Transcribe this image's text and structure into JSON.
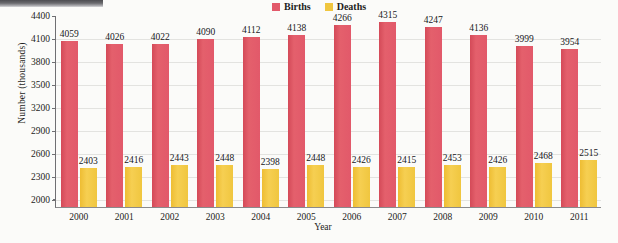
{
  "chart_data": {
    "type": "bar",
    "title": "",
    "xlabel": "Year",
    "ylabel": "Number (thousands)",
    "categories": [
      "2000",
      "2001",
      "2002",
      "2003",
      "2004",
      "2005",
      "2006",
      "2007",
      "2008",
      "2009",
      "2010",
      "2011"
    ],
    "series": [
      {
        "name": "Births",
        "color": "#e2596a",
        "values": [
          4059,
          4026,
          4022,
          4090,
          4112,
          4138,
          4266,
          4315,
          4247,
          4136,
          3999,
          3954
        ]
      },
      {
        "name": "Deaths",
        "color": "#f0c63f",
        "values": [
          2403,
          2416,
          2443,
          2448,
          2398,
          2448,
          2426,
          2415,
          2453,
          2426,
          2468,
          2515
        ]
      }
    ],
    "ylim": [
      1900,
      4400
    ],
    "yticks": [
      2000,
      2300,
      2600,
      2900,
      3200,
      3500,
      3800,
      4100,
      4400
    ],
    "grid": true,
    "legend_position": "top-right"
  },
  "legend": {
    "entries": [
      {
        "label": "Births",
        "color": "#e2596a"
      },
      {
        "label": "Deaths",
        "color": "#f0c63f"
      }
    ]
  },
  "axes": {
    "x_title": "Year",
    "y_title": "Number (thousands)"
  }
}
